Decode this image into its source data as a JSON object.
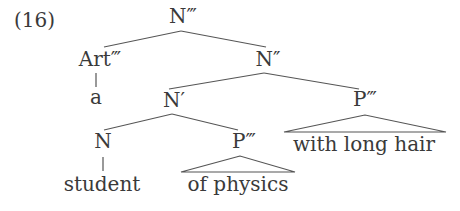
{
  "example_number": "(16)",
  "tree": {
    "root": "N‴",
    "art": "Art‴",
    "art_word": "a",
    "n_bar2": "N″",
    "n_bar1": "N′",
    "n": "N",
    "n_word": "student",
    "p_inner": "P‴",
    "p_inner_phrase": "of physics",
    "p_outer": "P‴",
    "p_outer_phrase": "with long hair"
  },
  "colors": {
    "text": "#3a3a3a",
    "lines": "#555555",
    "background": "#ffffff"
  }
}
